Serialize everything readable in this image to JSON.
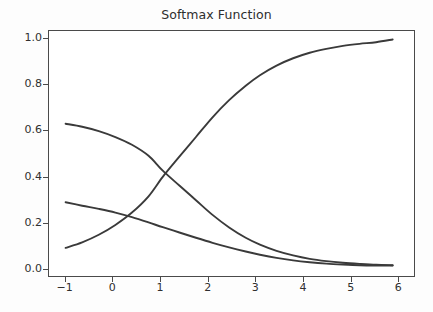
{
  "chart_data": {
    "type": "line",
    "title": "Softmax Function",
    "subtitle": "",
    "xlabel": "",
    "ylabel": "",
    "xlim": [
      -1.35,
      6.35
    ],
    "ylim": [
      -0.035,
      1.035
    ],
    "grid": false,
    "legend": null,
    "legend_position": "none",
    "xticks": [
      -1,
      0,
      1,
      2,
      3,
      4,
      5,
      6
    ],
    "xtick_labels": [
      "−1",
      "0",
      "1",
      "2",
      "3",
      "4",
      "5",
      "6"
    ],
    "yticks": [
      0.0,
      0.2,
      0.4,
      0.6,
      0.8,
      1.0
    ],
    "ytick_labels": [
      "0.0",
      "0.2",
      "0.4",
      "0.6",
      "0.8",
      "1.0"
    ],
    "x": [
      -1.0,
      -0.65,
      -0.3,
      0.05,
      0.4,
      0.75,
      1.05,
      1.4,
      1.75,
      2.1,
      2.45,
      2.8,
      3.1,
      3.45,
      3.8,
      4.15,
      4.5,
      4.85,
      5.2,
      5.55,
      5.9
    ],
    "series": [
      {
        "name": "class-1-rising",
        "color": "#3a3a3a",
        "linewidth": 1.9,
        "values": [
          0.088,
          0.112,
          0.145,
          0.188,
          0.242,
          0.313,
          0.398,
          0.486,
          0.572,
          0.658,
          0.733,
          0.796,
          0.842,
          0.884,
          0.916,
          0.94,
          0.957,
          0.97,
          0.979,
          0.986,
          0.998
        ]
      },
      {
        "name": "class-2-falling-steep",
        "color": "#3a3a3a",
        "linewidth": 1.9,
        "values": [
          0.63,
          0.617,
          0.598,
          0.572,
          0.538,
          0.49,
          0.425,
          0.36,
          0.296,
          0.232,
          0.177,
          0.132,
          0.102,
          0.075,
          0.055,
          0.04,
          0.03,
          0.023,
          0.018,
          0.014,
          0.012
        ]
      },
      {
        "name": "class-3-falling-shallow",
        "color": "#3a3a3a",
        "linewidth": 1.9,
        "values": [
          0.287,
          0.272,
          0.258,
          0.242,
          0.222,
          0.199,
          0.178,
          0.155,
          0.132,
          0.11,
          0.09,
          0.072,
          0.058,
          0.044,
          0.033,
          0.025,
          0.019,
          0.015,
          0.012,
          0.011,
          0.011
        ]
      }
    ],
    "annotations": [],
    "axis_color": "#4a4a4a",
    "background_color": "#ffffff",
    "figure_background_color": "#fdfdfd",
    "title_color": "#2e2e2e",
    "tick_label_color": "#2f2f2f"
  }
}
